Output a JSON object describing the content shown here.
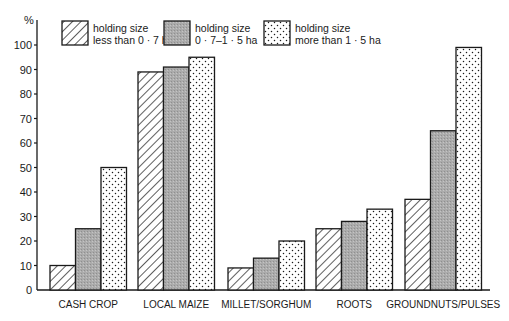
{
  "chart_data": {
    "type": "bar",
    "title": "",
    "xlabel": "",
    "ylabel": "%",
    "ylim": [
      0,
      100
    ],
    "yticks": [
      0,
      10,
      20,
      30,
      40,
      50,
      60,
      70,
      80,
      90,
      100
    ],
    "grid": false,
    "legend_position": "top",
    "categories": [
      "CASH CROP",
      "LOCAL MAIZE",
      "MILLET/SORGHUM",
      "ROOTS",
      "GROUNDNUTS/PULSES"
    ],
    "series": [
      {
        "name": "holding size less than 0 · 7 ha",
        "legend_line1": "holding size",
        "legend_line2": "less than 0 · 7 ha",
        "pattern": "hatched",
        "values": [
          10,
          89,
          9,
          25,
          37
        ]
      },
      {
        "name": "holding size 0 · 7–1 · 5 ha",
        "legend_line1": "holding size",
        "legend_line2": "0 · 7–1 · 5 ha",
        "pattern": "grey",
        "values": [
          25,
          91,
          13,
          28,
          65
        ]
      },
      {
        "name": "holding size more than 1 · 5 ha",
        "legend_line1": "holding size",
        "legend_line2": "more than 1 · 5 ha",
        "pattern": "dotted",
        "values": [
          50,
          95,
          20,
          33,
          99
        ]
      }
    ]
  },
  "colors": {
    "ink": "#1a1a1a",
    "grey_fill": "#a8a8a8",
    "background": "#ffffff"
  }
}
